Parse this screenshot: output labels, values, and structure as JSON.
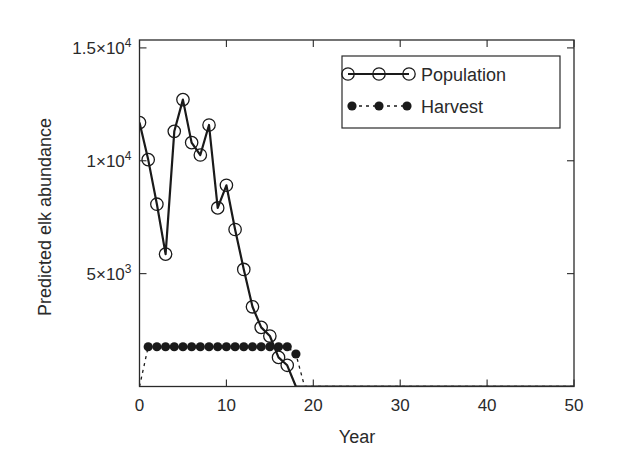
{
  "chart_data": {
    "type": "line",
    "title": "",
    "xlabel": "Year",
    "ylabel": "Predicted elk abundance",
    "xlim": [
      0,
      50
    ],
    "ylim": [
      0,
      15350
    ],
    "grid": false,
    "legend_position": "upper right",
    "x_ticks": [
      0,
      10,
      20,
      30,
      40,
      50
    ],
    "x_tick_labels": [
      "0",
      "10",
      "20",
      "30",
      "40",
      "50"
    ],
    "y_ticks": [
      5000,
      10000,
      15000
    ],
    "y_tick_labels": [
      {
        "mantissa": "5",
        "exp": "3"
      },
      {
        "mantissa": "1",
        "exp": "4"
      },
      {
        "mantissa": "1.5",
        "exp": "4"
      }
    ],
    "series": [
      {
        "name": "Population",
        "style": "solid line with open circle markers",
        "x": [
          0,
          1,
          2,
          3,
          4,
          5,
          6,
          7,
          8,
          9,
          10,
          11,
          12,
          13,
          14,
          15,
          16,
          17,
          18,
          19,
          20,
          21,
          22,
          23,
          24,
          25,
          26,
          27,
          28,
          29,
          30,
          31,
          32,
          33,
          34,
          35,
          36,
          37,
          38,
          39,
          40,
          41,
          42,
          43,
          44,
          45,
          46,
          47,
          48,
          49,
          50
        ],
        "values": [
          11690,
          10050,
          8075,
          5865,
          11305,
          12710,
          10805,
          10255,
          11585,
          7910,
          8915,
          6955,
          5185,
          3530,
          2620,
          2235,
          1290,
          940,
          0,
          0,
          0,
          0,
          0,
          0,
          0,
          0,
          0,
          0,
          0,
          0,
          0,
          0,
          0,
          0,
          0,
          0,
          0,
          0,
          0,
          0,
          0,
          0,
          0,
          0,
          0,
          0,
          0,
          0,
          0,
          0,
          0
        ],
        "markers_shown_through_index": 17
      },
      {
        "name": "Harvest",
        "style": "dashed line with filled circle markers",
        "x": [
          0,
          1,
          2,
          3,
          4,
          5,
          6,
          7,
          8,
          9,
          10,
          11,
          12,
          13,
          14,
          15,
          16,
          17,
          18,
          19,
          20,
          21,
          22,
          23,
          24,
          25,
          26,
          27,
          28,
          29,
          30,
          31,
          32,
          33,
          34,
          35,
          36,
          37,
          38,
          39,
          40,
          41,
          42,
          43,
          44,
          45,
          46,
          47,
          48,
          49,
          50
        ],
        "values": [
          0,
          1760,
          1760,
          1760,
          1760,
          1760,
          1760,
          1760,
          1760,
          1760,
          1760,
          1760,
          1760,
          1760,
          1760,
          1760,
          1760,
          1760,
          1440,
          0,
          0,
          0,
          0,
          0,
          0,
          0,
          0,
          0,
          0,
          0,
          0,
          0,
          0,
          0,
          0,
          0,
          0,
          0,
          0,
          0,
          0,
          0,
          0,
          0,
          0,
          0,
          0,
          0,
          0,
          0,
          0
        ],
        "markers_shown_from_index": 1,
        "markers_shown_through_index": 18
      }
    ]
  },
  "legend": {
    "items": [
      {
        "label": "Population"
      },
      {
        "label": "Harvest"
      }
    ]
  },
  "colors": {
    "line": "#1a1a1a",
    "axis": "#2a2a2a",
    "background": "#ffffff"
  }
}
